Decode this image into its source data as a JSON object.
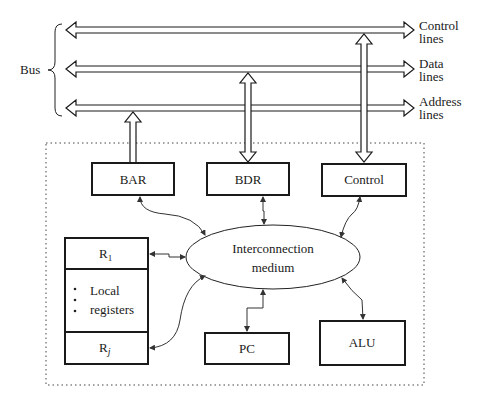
{
  "diagram": {
    "bus_label": "Bus",
    "bus_lines": [
      {
        "id": "control",
        "line1": "Control",
        "line2": "lines"
      },
      {
        "id": "data",
        "line1": "Data",
        "line2": "lines"
      },
      {
        "id": "address",
        "line1": "Address",
        "line2": "lines"
      }
    ],
    "blocks": {
      "bar": "BAR",
      "bdr": "BDR",
      "control": "Control",
      "r1": "R",
      "r1_sub": "1",
      "local_registers_line1": "Local",
      "local_registers_line2": "registers",
      "rj": "R",
      "rj_sub": "j",
      "pc": "PC",
      "alu": "ALU"
    },
    "interconnect": {
      "line1": "Interconnection",
      "line2": "medium"
    },
    "connections": [
      {
        "from": "BAR",
        "to": "Address lines",
        "direction": "to-bus"
      },
      {
        "from": "Data lines",
        "to": "BDR",
        "direction": "bidirectional"
      },
      {
        "from": "Control lines",
        "to": "Control",
        "direction": "bidirectional"
      },
      {
        "from": "Interconnection medium",
        "to": "BAR"
      },
      {
        "from": "Interconnection medium",
        "to": "BDR"
      },
      {
        "from": "Interconnection medium",
        "to": "Control"
      },
      {
        "from": "Interconnection medium",
        "to": "R1"
      },
      {
        "from": "Interconnection medium",
        "to": "Rj"
      },
      {
        "from": "Interconnection medium",
        "to": "PC"
      },
      {
        "from": "Interconnection medium",
        "to": "ALU"
      }
    ]
  }
}
